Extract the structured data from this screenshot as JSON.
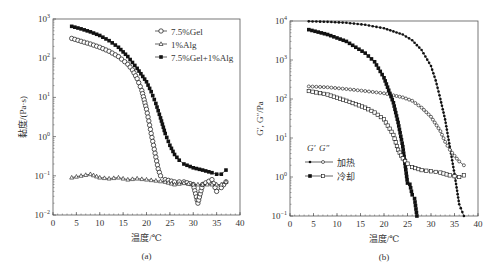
{
  "chart_data": [
    {
      "type": "line",
      "panel_label": "(a)",
      "xlabel": "温度/℃",
      "ylabel": "黏度/(Pa·s)",
      "xlim": [
        0,
        40
      ],
      "ylim": [
        0.01,
        1000
      ],
      "yscale": "log",
      "xticks": [
        "0",
        "5",
        "10",
        "15",
        "20",
        "25",
        "30",
        "35",
        "40"
      ],
      "yticks": [
        "10^-2",
        "10^-1",
        "10^0",
        "10^1",
        "10^2",
        "10^3"
      ],
      "legend_position": "upper right",
      "series": [
        {
          "name": "7.5%Gel",
          "marker": "open-circle",
          "x": [
            4,
            6,
            8,
            10,
            12,
            14,
            16,
            17,
            18,
            19,
            20,
            20.5,
            21,
            21.5,
            22,
            22.5,
            23,
            24,
            26,
            28,
            30,
            31,
            32,
            34,
            35,
            36,
            37
          ],
          "y": [
            320,
            270,
            230,
            190,
            150,
            110,
            70,
            50,
            30,
            15,
            5,
            2.5,
            1.2,
            0.6,
            0.3,
            0.15,
            0.1,
            0.08,
            0.07,
            0.07,
            0.06,
            0.02,
            0.06,
            0.08,
            0.04,
            0.05,
            0.07
          ]
        },
        {
          "name": "1%Alg",
          "marker": "open-triangle",
          "x": [
            4,
            6,
            8,
            10,
            12,
            14,
            16,
            18,
            20,
            22,
            24,
            26,
            28,
            30,
            32,
            34,
            36,
            37
          ],
          "y": [
            0.09,
            0.1,
            0.11,
            0.09,
            0.085,
            0.09,
            0.08,
            0.085,
            0.08,
            0.075,
            0.07,
            0.06,
            0.065,
            0.06,
            0.06,
            0.06,
            0.06,
            0.07
          ]
        },
        {
          "name": "7.5%Gel+1%Alg",
          "marker": "filled-square",
          "x": [
            4,
            6,
            8,
            10,
            12,
            14,
            16,
            18,
            20,
            21,
            22,
            23,
            24,
            25,
            26,
            27,
            28,
            30,
            32,
            34,
            35,
            36,
            37
          ],
          "y": [
            650,
            560,
            470,
            380,
            280,
            190,
            110,
            55,
            25,
            14,
            7,
            3,
            1.2,
            0.6,
            0.35,
            0.25,
            0.2,
            0.16,
            0.14,
            0.12,
            0.11,
            0.11,
            0.14
          ]
        }
      ]
    },
    {
      "type": "line",
      "panel_label": "(b)",
      "xlabel": "温度/℃",
      "ylabel": "G′, G″/Pa",
      "xlim": [
        0,
        40
      ],
      "ylim": [
        0.1,
        10000
      ],
      "yscale": "log",
      "xticks": [
        "0",
        "5",
        "10",
        "15",
        "20",
        "25",
        "30",
        "35",
        "40"
      ],
      "yticks": [
        "10^-1",
        "10^0",
        "10^1",
        "10^2",
        "10^3",
        "10^4"
      ],
      "legend_position": "lower left",
      "legend": {
        "header": [
          "G′",
          "G″"
        ],
        "rows": [
          "加热",
          "冷却"
        ]
      },
      "series": [
        {
          "name": "G′ 加热",
          "marker": "small-filled-circle",
          "x": [
            4,
            8,
            12,
            16,
            20,
            24,
            26,
            28,
            30,
            31,
            32,
            33,
            34,
            35,
            36,
            37
          ],
          "y": [
            9800,
            9500,
            9000,
            8000,
            6500,
            4500,
            3200,
            1800,
            700,
            300,
            100,
            30,
            6,
            1.2,
            0.2,
            0.1
          ]
        },
        {
          "name": "G″ 加热",
          "marker": "small-open-circle",
          "x": [
            4,
            8,
            12,
            16,
            20,
            24,
            26,
            28,
            30,
            32,
            33,
            34,
            35,
            36,
            37
          ],
          "y": [
            210,
            200,
            180,
            160,
            140,
            110,
            90,
            60,
            35,
            15,
            8,
            5,
            3.5,
            2.5,
            2
          ]
        },
        {
          "name": "G′ 冷却",
          "marker": "filled-square",
          "x": [
            4,
            8,
            12,
            16,
            18,
            20,
            22,
            23,
            24,
            25,
            25.5,
            26,
            26.5,
            27
          ],
          "y": [
            6000,
            4500,
            3000,
            1500,
            900,
            350,
            80,
            25,
            6,
            0.7,
            0.65,
            0.35,
            0.28,
            0.1
          ]
        },
        {
          "name": "G″ 冷却",
          "marker": "open-square",
          "x": [
            4,
            8,
            12,
            16,
            18,
            20,
            22,
            23,
            24,
            25,
            26,
            28,
            30,
            32,
            34,
            36,
            37
          ],
          "y": [
            160,
            130,
            90,
            60,
            45,
            30,
            12,
            5,
            3,
            2.2,
            1.8,
            1.5,
            1.4,
            1.3,
            1.1,
            1,
            1.1
          ]
        }
      ]
    }
  ]
}
